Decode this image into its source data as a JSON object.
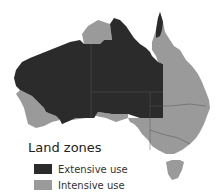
{
  "map": {
    "region": "Australia",
    "colors": {
      "extensive": "#2b2b2b",
      "intensive": "#9a9a9a",
      "border": "#555555",
      "background": "#ffffff"
    }
  },
  "legend": {
    "title": "Land zones",
    "items": [
      {
        "label": "Extensive use",
        "color": "#2b2b2b"
      },
      {
        "label": "Intensive use",
        "color": "#9a9a9a"
      }
    ]
  }
}
